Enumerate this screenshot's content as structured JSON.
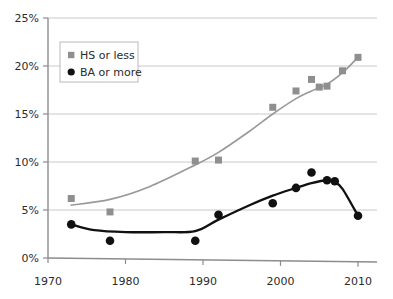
{
  "chart_data": {
    "type": "scatter",
    "title": "",
    "subtitle": "",
    "xlabel": "",
    "ylabel": "",
    "xlim": [
      1970,
      2012
    ],
    "ylim": [
      0,
      25
    ],
    "grid": true,
    "legend_position": "top-left",
    "x_ticks": [
      1970,
      1980,
      1990,
      2000,
      2010
    ],
    "x_tick_labels": [
      "1970",
      "1980",
      "1990",
      "2000",
      "2010"
    ],
    "y_ticks": [
      0,
      5,
      10,
      15,
      20,
      25
    ],
    "y_tick_labels": [
      "0%",
      "5%",
      "10%",
      "15%",
      "20%",
      "25%"
    ],
    "series": [
      {
        "name": "HS or less",
        "marker": "square",
        "color": "#8f8f8f",
        "line_color": "#9a9a9a",
        "points": [
          {
            "x": 1973,
            "y": 6.2
          },
          {
            "x": 1978,
            "y": 4.8
          },
          {
            "x": 1989,
            "y": 10.1
          },
          {
            "x": 1992,
            "y": 10.2
          },
          {
            "x": 1999,
            "y": 15.7
          },
          {
            "x": 2002,
            "y": 17.4
          },
          {
            "x": 2004,
            "y": 18.6
          },
          {
            "x": 2005,
            "y": 17.8
          },
          {
            "x": 2006,
            "y": 17.9
          },
          {
            "x": 2008,
            "y": 19.5
          },
          {
            "x": 2010,
            "y": 20.9
          }
        ],
        "trend": [
          {
            "x": 1973,
            "y": 5.5
          },
          {
            "x": 1978,
            "y": 6.1
          },
          {
            "x": 1983,
            "y": 7.4
          },
          {
            "x": 1989,
            "y": 9.7
          },
          {
            "x": 1992,
            "y": 11.0
          },
          {
            "x": 1996,
            "y": 13.2
          },
          {
            "x": 1999,
            "y": 15.0
          },
          {
            "x": 2002,
            "y": 16.6
          },
          {
            "x": 2004,
            "y": 17.4
          },
          {
            "x": 2006,
            "y": 18.1
          },
          {
            "x": 2008,
            "y": 19.3
          },
          {
            "x": 2010,
            "y": 20.9
          }
        ]
      },
      {
        "name": "BA or more",
        "marker": "circle",
        "color": "#111111",
        "line_color": "#111111",
        "points": [
          {
            "x": 1973,
            "y": 3.5
          },
          {
            "x": 1978,
            "y": 1.8
          },
          {
            "x": 1989,
            "y": 1.8
          },
          {
            "x": 1992,
            "y": 4.5
          },
          {
            "x": 1999,
            "y": 5.7
          },
          {
            "x": 2002,
            "y": 7.3
          },
          {
            "x": 2004,
            "y": 8.9
          },
          {
            "x": 2006,
            "y": 8.1
          },
          {
            "x": 2007,
            "y": 8.0
          },
          {
            "x": 2010,
            "y": 4.4
          }
        ],
        "trend": [
          {
            "x": 1973,
            "y": 3.5
          },
          {
            "x": 1976,
            "y": 2.9
          },
          {
            "x": 1980,
            "y": 2.7
          },
          {
            "x": 1985,
            "y": 2.7
          },
          {
            "x": 1989,
            "y": 2.8
          },
          {
            "x": 1992,
            "y": 4.0
          },
          {
            "x": 1996,
            "y": 5.5
          },
          {
            "x": 1999,
            "y": 6.5
          },
          {
            "x": 2002,
            "y": 7.3
          },
          {
            "x": 2004,
            "y": 7.8
          },
          {
            "x": 2006,
            "y": 8.1
          },
          {
            "x": 2007,
            "y": 7.9
          },
          {
            "x": 2008,
            "y": 7.2
          },
          {
            "x": 2010,
            "y": 4.4
          }
        ]
      }
    ],
    "colors": {
      "series_hs": "#8f8f8f",
      "series_ba": "#111111",
      "grid": "#c9c9c9",
      "axis": "#8c8c8c",
      "text": "#2b2b2b",
      "background": "#ffffff"
    }
  },
  "legend": {
    "items": [
      {
        "label": "HS or less",
        "marker": "square-marker",
        "color": "#8f8f8f"
      },
      {
        "label": "BA or more",
        "marker": "circle-marker",
        "color": "#111111"
      }
    ]
  }
}
